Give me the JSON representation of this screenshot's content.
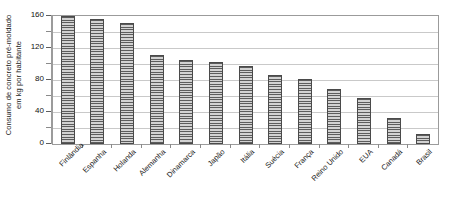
{
  "chart_data": {
    "type": "bar",
    "title": "",
    "subtitle": "",
    "xlabel": "",
    "ylabel": "Consumo de concreto pré-moldado em kg por habitante",
    "ylabel_lines": [
      "Consumo de concreto pré-moldado",
      "em kg por habitante"
    ],
    "categories": [
      "Finlândia",
      "Espanha",
      "Holanda",
      "Alemanha",
      "Dinamarca",
      "Japão",
      "Itália",
      "Suécia",
      "França",
      "Reino Unido",
      "EUA",
      "Canadá",
      "Brasil"
    ],
    "values": [
      160,
      156,
      151,
      111,
      105,
      103,
      98,
      86,
      81,
      69,
      58,
      33,
      12
    ],
    "ylim": [
      0,
      160
    ],
    "ytick_major": [
      0,
      40,
      80,
      120,
      160
    ],
    "ytick_minor": [
      20,
      60,
      100,
      140
    ],
    "ytick_labels": [
      "0",
      "40",
      "80",
      "120",
      "160"
    ],
    "gridlines": [
      20,
      40,
      60,
      80,
      100,
      120,
      140
    ],
    "grid": true,
    "legend": false,
    "legend_position": "none",
    "bar_fill": "#8d8d8d",
    "bar_hatch": "horizontal-lines",
    "bar_edge_color": "#4a4a4a",
    "gridline_color": "#c9c9c9",
    "plot_border_color": "#9b9b9b",
    "background_color": "#ffffff",
    "text_color": "#1a1a1a"
  }
}
